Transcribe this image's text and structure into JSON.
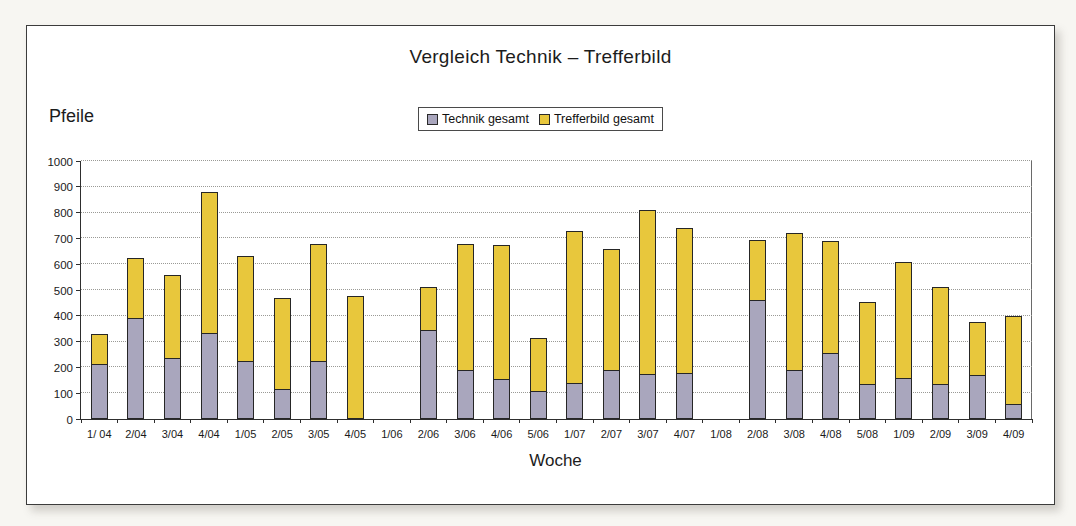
{
  "panel": {
    "title": "Vergleich Technik – Trefferbild"
  },
  "chart_data": {
    "type": "bar",
    "stacked": true,
    "title": "Vergleich Technik – Trefferbild",
    "xlabel": "Woche",
    "ylabel": "Pfeile",
    "ylim": [
      0,
      1000
    ],
    "ytick_step": 100,
    "grid": "horizontal-dotted",
    "legend_position": "top-center",
    "categories": [
      "1/ 04",
      "2/04",
      "3/04",
      "4/04",
      "1/05",
      "2/05",
      "3/05",
      "4/05",
      "1/06",
      "2/06",
      "3/06",
      "4/06",
      "5/06",
      "1/07",
      "2/07",
      "3/07",
      "4/07",
      "1/08",
      "2/08",
      "3/08",
      "4/08",
      "5/08",
      "1/09",
      "2/09",
      "3/09",
      "4/09"
    ],
    "series": [
      {
        "name": "Technik gesamt",
        "color": "#a9a6bd",
        "values": [
          215,
          390,
          235,
          335,
          225,
          115,
          225,
          0,
          0,
          345,
          190,
          155,
          110,
          140,
          190,
          175,
          180,
          0,
          460,
          190,
          255,
          135,
          160,
          135,
          170,
          60
        ]
      },
      {
        "name": "Trefferbild gesamt",
        "color": "#e8c73c",
        "values": [
          115,
          235,
          325,
          545,
          405,
          355,
          455,
          475,
          0,
          165,
          490,
          520,
          205,
          590,
          470,
          635,
          560,
          0,
          235,
          530,
          435,
          320,
          450,
          375,
          205,
          340
        ]
      }
    ],
    "stack_totals": [
      330,
      625,
      560,
      880,
      630,
      470,
      680,
      475,
      0,
      510,
      680,
      675,
      315,
      730,
      660,
      810,
      740,
      0,
      695,
      720,
      690,
      455,
      610,
      510,
      375,
      400
    ]
  },
  "colors": {
    "technik_fill": "#a9a6bd",
    "trefferbild_fill": "#e8c73c",
    "bar_border": "#262626",
    "gridline": "#9a9a96",
    "axis": "#2e2e2e",
    "panel_border": "#3c3c3c",
    "panel_bg": "#ffffff",
    "page_bg": "#f7f6f2"
  }
}
